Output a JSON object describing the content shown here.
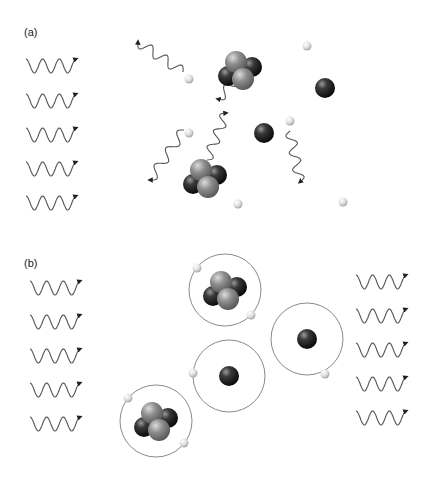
{
  "panels": [
    {
      "label": "(a)",
      "label_pos": [
        24,
        32
      ],
      "description": "Photons ionize atoms: nuclei and free electrons separate, emitted photons scatter",
      "incoming_photons": [
        {
          "x": 26,
          "y": 60
        },
        {
          "x": 26,
          "y": 95
        },
        {
          "x": 26,
          "y": 129
        },
        {
          "x": 26,
          "y": 163
        },
        {
          "x": 26,
          "y": 197
        }
      ],
      "scattered_photons": [
        {
          "from": [
            183,
            72
          ],
          "to": [
            138,
            42
          ]
        },
        {
          "from": [
            257,
            59
          ],
          "to": [
            218,
            99
          ]
        },
        {
          "from": [
            184,
            130
          ],
          "to": [
            150,
            180
          ]
        },
        {
          "from": [
            207,
            160
          ],
          "to": [
            226,
            113
          ]
        },
        {
          "from": [
            290,
            131
          ],
          "to": [
            300,
            182
          ]
        }
      ],
      "nuclei_multi": [
        {
          "cx": 240,
          "cy": 70
        },
        {
          "cx": 205,
          "cy": 178
        }
      ],
      "nuclei_single": [
        {
          "cx": 325,
          "cy": 88
        },
        {
          "cx": 264,
          "cy": 133
        }
      ],
      "electrons": [
        {
          "cx": 189,
          "cy": 79
        },
        {
          "cx": 307,
          "cy": 46
        },
        {
          "cx": 189,
          "cy": 133
        },
        {
          "cx": 290,
          "cy": 121
        },
        {
          "cx": 238,
          "cy": 204
        },
        {
          "cx": 343,
          "cy": 202
        }
      ]
    },
    {
      "label": "(b)",
      "label_pos": [
        24,
        263
      ],
      "description": "Neutral atoms with bound electrons in orbits; photons pass through",
      "incoming_photons": [
        {
          "x": 30,
          "y": 282
        },
        {
          "x": 30,
          "y": 316
        },
        {
          "x": 30,
          "y": 350
        },
        {
          "x": 30,
          "y": 384
        },
        {
          "x": 30,
          "y": 418
        }
      ],
      "outgoing_photons": [
        {
          "x": 356,
          "y": 276
        },
        {
          "x": 356,
          "y": 310
        },
        {
          "x": 356,
          "y": 344
        },
        {
          "x": 356,
          "y": 378
        },
        {
          "x": 356,
          "y": 412
        }
      ],
      "atoms": [
        {
          "cx": 225,
          "cy": 290,
          "r": 36,
          "type": "helium",
          "electrons": [
            [
              197,
              268
            ],
            [
              251,
              315
            ]
          ]
        },
        {
          "cx": 229,
          "cy": 376,
          "r": 36,
          "type": "hydrogen",
          "electrons": [
            [
              193,
              373
            ]
          ]
        },
        {
          "cx": 307,
          "cy": 339,
          "r": 36,
          "type": "hydrogen",
          "electrons": [
            [
              325,
              374
            ]
          ]
        },
        {
          "cx": 156,
          "cy": 421,
          "r": 36,
          "type": "helium",
          "electrons": [
            [
              128,
              398
            ],
            [
              184,
              443
            ]
          ]
        }
      ]
    }
  ],
  "colors": {
    "background": "#ffffff",
    "line": "#555555",
    "orbit": "#8a8a8a",
    "proton_dark": "#1a1a1a",
    "neutron_light": "#8c8c8c",
    "electron": "#e0e0e0"
  }
}
